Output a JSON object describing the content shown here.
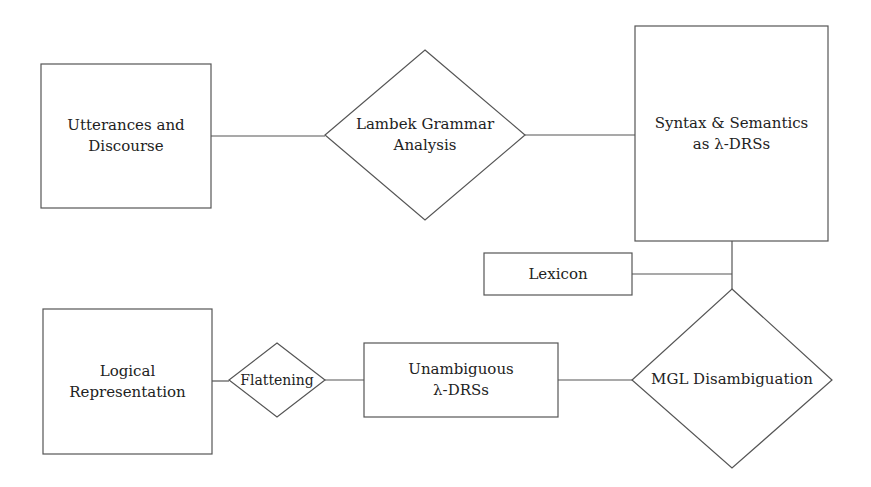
{
  "diagram": {
    "colors": {
      "stroke": "#555555",
      "text": "#222222",
      "background": "#ffffff"
    },
    "nodes": {
      "utterances": {
        "shape": "rectangle",
        "lines": [
          "Utterances and",
          "Discourse"
        ]
      },
      "lambek": {
        "shape": "diamond",
        "lines": [
          "Lambek Grammar",
          "Analysis"
        ]
      },
      "syntax": {
        "shape": "rectangle",
        "lines": [
          "Syntax & Semantics",
          "as λ-DRSs"
        ]
      },
      "lexicon": {
        "shape": "rectangle",
        "lines": [
          "Lexicon"
        ]
      },
      "mgl": {
        "shape": "diamond",
        "lines": [
          "MGL Disambiguation"
        ]
      },
      "unambiguous": {
        "shape": "rectangle",
        "lines": [
          "Unambiguous",
          "λ-DRSs"
        ]
      },
      "flattening": {
        "shape": "diamond",
        "lines": [
          "Flattening"
        ]
      },
      "logical": {
        "shape": "rectangle",
        "lines": [
          "Logical",
          "Representation"
        ]
      }
    },
    "edges": [
      [
        "utterances",
        "lambek"
      ],
      [
        "lambek",
        "syntax"
      ],
      [
        "syntax",
        "mgl"
      ],
      [
        "lexicon",
        "mgl"
      ],
      [
        "mgl",
        "unambiguous"
      ],
      [
        "unambiguous",
        "flattening"
      ],
      [
        "flattening",
        "logical"
      ]
    ]
  }
}
